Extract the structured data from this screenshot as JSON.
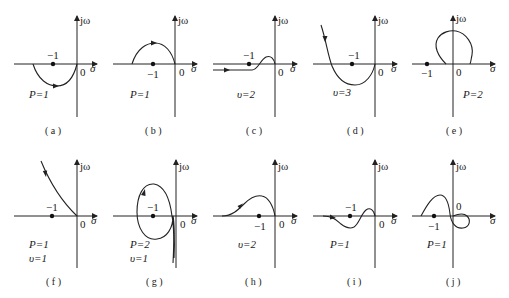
{
  "figure": {
    "axis_labels": {
      "imag": "jω",
      "real": "σ",
      "origin": "0",
      "critical_point": "−1"
    },
    "panels": [
      {
        "id": "a",
        "caption": "( a )",
        "params": [
          "P=1"
        ],
        "description": "Semicircle below real axis from left of −1 to origin, arrow pointing right"
      },
      {
        "id": "b",
        "caption": "( b )",
        "params": [
          "P=1"
        ],
        "description": "Arc above real axis from left of −1 to origin, arrow pointing right"
      },
      {
        "id": "c",
        "caption": "( c )",
        "params": [
          "υ=2"
        ],
        "description": "Curve from −∞ along real axis, small bump above axis ending at origin"
      },
      {
        "id": "d",
        "caption": "( d )",
        "params": [
          "υ=3"
        ],
        "description": "Curve from upper-left down through real axis, loops below −1, ends at origin"
      },
      {
        "id": "e",
        "caption": "( e )",
        "params": [
          "P=2"
        ],
        "description": "Closed loop above real axis right of −1"
      },
      {
        "id": "f",
        "caption": "( f )",
        "params": [
          "P=1",
          "υ=1"
        ],
        "description": "Curve from upper-left descending to origin"
      },
      {
        "id": "g",
        "caption": "( g )",
        "params": [
          "P=2",
          "υ=1"
        ],
        "description": "Closed loop encircling −1, tail going down near imaginary axis"
      },
      {
        "id": "h",
        "caption": "( h )",
        "params": [
          "υ=2"
        ],
        "description": "Curve from −∞ along real axis rising above then ending at origin"
      },
      {
        "id": "i",
        "caption": "( i )",
        "params": [
          "P=1"
        ],
        "description": "Curve from −∞, dips below axis, crosses near −1, bump above, ends at origin"
      },
      {
        "id": "j",
        "caption": "( j )",
        "params": [
          "P=1"
        ],
        "description": "Curve from left of −1 rising above, crosses down through axis, loops below right of origin"
      }
    ]
  }
}
